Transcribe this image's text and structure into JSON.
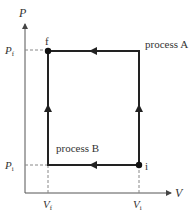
{
  "diagram": {
    "type": "PV process diagram",
    "axes": {
      "x_label": "V",
      "y_label": "P"
    },
    "ticks": {
      "x": [
        {
          "main": "V",
          "sub": "f"
        },
        {
          "main": "V",
          "sub": "i"
        }
      ],
      "y": [
        {
          "main": "P",
          "sub": "f"
        },
        {
          "main": "P",
          "sub": "i"
        }
      ]
    },
    "points": {
      "initial": "i",
      "final": "f"
    },
    "processes": {
      "a": "process A",
      "b": "process B"
    },
    "colors": {
      "line": "#222222",
      "axis": "#555555",
      "dashed": "#888888",
      "text": "#333333"
    }
  }
}
